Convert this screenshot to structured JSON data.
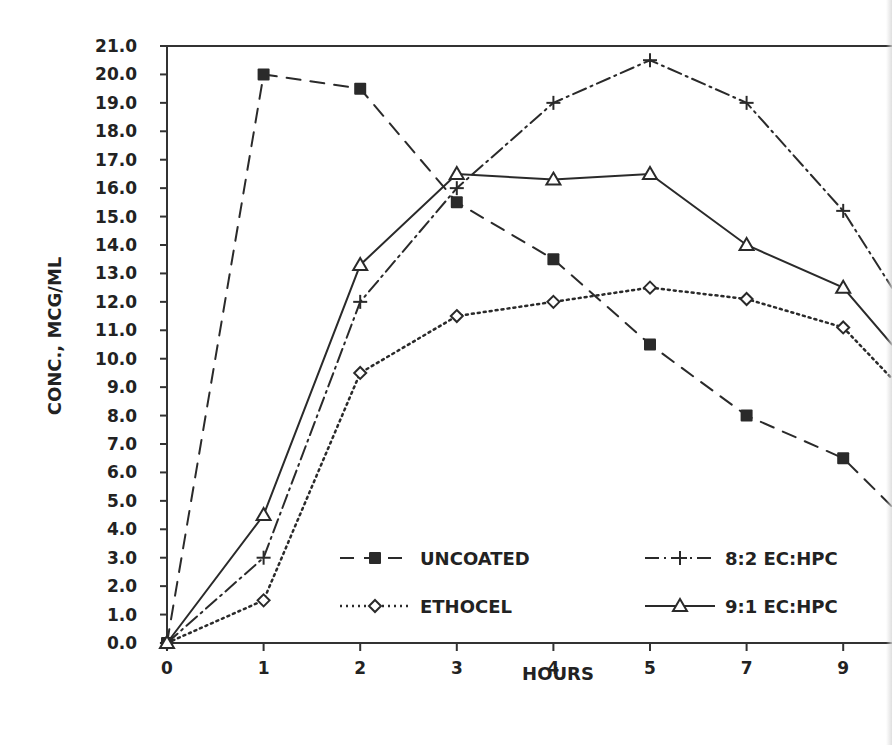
{
  "chart_data": {
    "type": "line",
    "title": "",
    "xlabel": "HOURS",
    "ylabel": "CONC., MCG/ML",
    "categories": [
      "0",
      "1",
      "2",
      "3",
      "4",
      "5",
      "7",
      "9"
    ],
    "x": [
      0,
      1,
      2,
      3,
      4,
      5,
      7,
      9
    ],
    "ylim": [
      0,
      21
    ],
    "yticks": [
      "0.0",
      "1.0",
      "2.0",
      "3.0",
      "4.0",
      "5.0",
      "6.0",
      "7.0",
      "8.0",
      "9.0",
      "10.0",
      "11.0",
      "12.0",
      "13.0",
      "14.0",
      "15.0",
      "16.0",
      "17.0",
      "18.0",
      "19.0",
      "20.0",
      "21.0"
    ],
    "grid": false,
    "legend_position": "lower right (inside plot)",
    "x_spacing": "categorical, equally spaced",
    "note": "Image cropped at right edge; series lines continue beyond x=9",
    "series": [
      {
        "name": "UNCOATED",
        "line_style": "dashed",
        "marker": "filled-square",
        "values": [
          0.0,
          20.0,
          19.5,
          15.5,
          13.5,
          10.5,
          8.0,
          6.5
        ],
        "continues_to": 4.8
      },
      {
        "name": "ETHOCEL",
        "line_style": "dotted",
        "marker": "open-diamond",
        "values": [
          0.0,
          1.5,
          9.5,
          11.5,
          12.0,
          12.5,
          12.1,
          11.1
        ],
        "continues_to": 9.3
      },
      {
        "name": "8:2 EC:HPC",
        "line_style": "dash-dot",
        "marker": "plus",
        "values": [
          0.0,
          3.0,
          12.0,
          16.0,
          19.0,
          20.5,
          19.0,
          15.2
        ],
        "continues_to": 12.5
      },
      {
        "name": "9:1 EC:HPC",
        "line_style": "solid",
        "marker": "open-triangle",
        "values": [
          0.0,
          4.5,
          13.3,
          16.5,
          16.3,
          16.5,
          14.0,
          12.5
        ],
        "continues_to": 10.5
      }
    ]
  },
  "legend": {
    "items": [
      {
        "label": "UNCOATED"
      },
      {
        "label": "ETHOCEL"
      },
      {
        "label": "8:2 EC:HPC"
      },
      {
        "label": "9:1 EC:HPC"
      }
    ]
  },
  "colors": {
    "ink": "#2a2a2a",
    "background": "#ffffff"
  }
}
